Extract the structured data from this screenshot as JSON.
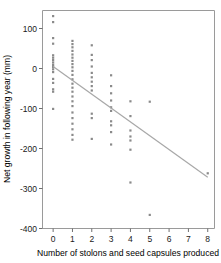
{
  "chart_data": {
    "type": "scatter",
    "title": "",
    "xlabel": "Number of stolons and seed capsules produced",
    "ylabel": "Net growth in following year (mm)",
    "xlim": [
      -0.55,
      8.35
    ],
    "ylim": [
      -400,
      145
    ],
    "xticks": [
      0,
      1,
      2,
      3,
      4,
      5,
      6,
      7,
      8
    ],
    "xticklabels": [
      "0",
      "1",
      "2",
      "3",
      "4",
      "5",
      "6",
      "7",
      "8"
    ],
    "yticks": [
      100,
      0,
      -100,
      -200,
      -300,
      -400
    ],
    "yticklabels": [
      "100",
      "0",
      "-100",
      "-200",
      "-300",
      "-400"
    ],
    "grid": false,
    "legend": null,
    "marker": "square",
    "marker_color": "#8a8a8a",
    "points": [
      {
        "x": 0,
        "y": 131
      },
      {
        "x": 0,
        "y": 116
      },
      {
        "x": 0,
        "y": 76
      },
      {
        "x": 0,
        "y": 62
      },
      {
        "x": 0,
        "y": 33
      },
      {
        "x": 0,
        "y": 27
      },
      {
        "x": 0,
        "y": 21
      },
      {
        "x": 0,
        "y": 15
      },
      {
        "x": 0,
        "y": 9
      },
      {
        "x": 0,
        "y": 4
      },
      {
        "x": 0,
        "y": -2
      },
      {
        "x": 0,
        "y": -9
      },
      {
        "x": 0,
        "y": -26
      },
      {
        "x": 0,
        "y": -36
      },
      {
        "x": 0,
        "y": -52
      },
      {
        "x": 0,
        "y": -58
      },
      {
        "x": 0,
        "y": -101
      },
      {
        "x": 1,
        "y": 69
      },
      {
        "x": 1,
        "y": 61
      },
      {
        "x": 1,
        "y": 53
      },
      {
        "x": 1,
        "y": 44
      },
      {
        "x": 1,
        "y": 35
      },
      {
        "x": 1,
        "y": 27
      },
      {
        "x": 1,
        "y": 19
      },
      {
        "x": 1,
        "y": 11
      },
      {
        "x": 1,
        "y": 3
      },
      {
        "x": 1,
        "y": -6
      },
      {
        "x": 1,
        "y": -16
      },
      {
        "x": 1,
        "y": -27
      },
      {
        "x": 1,
        "y": -38
      },
      {
        "x": 1,
        "y": -48
      },
      {
        "x": 1,
        "y": -58
      },
      {
        "x": 1,
        "y": -70
      },
      {
        "x": 1,
        "y": -82
      },
      {
        "x": 1,
        "y": -94
      },
      {
        "x": 1,
        "y": -110
      },
      {
        "x": 1,
        "y": -124
      },
      {
        "x": 1,
        "y": -138
      },
      {
        "x": 1,
        "y": -152
      },
      {
        "x": 1,
        "y": -166
      },
      {
        "x": 1,
        "y": -178
      },
      {
        "x": 2,
        "y": 58
      },
      {
        "x": 2,
        "y": 34
      },
      {
        "x": 2,
        "y": 21
      },
      {
        "x": 2,
        "y": 5
      },
      {
        "x": 2,
        "y": -11
      },
      {
        "x": 2,
        "y": -22
      },
      {
        "x": 2,
        "y": -33
      },
      {
        "x": 2,
        "y": -44
      },
      {
        "x": 2,
        "y": -55
      },
      {
        "x": 2,
        "y": -113
      },
      {
        "x": 2,
        "y": -124
      },
      {
        "x": 2,
        "y": -176
      },
      {
        "x": 3,
        "y": -17
      },
      {
        "x": 3,
        "y": -44
      },
      {
        "x": 3,
        "y": -62
      },
      {
        "x": 3,
        "y": -80
      },
      {
        "x": 3,
        "y": -97
      },
      {
        "x": 3,
        "y": -106
      },
      {
        "x": 3,
        "y": -132
      },
      {
        "x": 3,
        "y": -142
      },
      {
        "x": 3,
        "y": -159
      },
      {
        "x": 3,
        "y": -190
      },
      {
        "x": 4,
        "y": -82
      },
      {
        "x": 4,
        "y": -119
      },
      {
        "x": 4,
        "y": -155
      },
      {
        "x": 4,
        "y": -170
      },
      {
        "x": 4,
        "y": -180
      },
      {
        "x": 4,
        "y": -203
      },
      {
        "x": 4,
        "y": -285
      },
      {
        "x": 5,
        "y": -83
      },
      {
        "x": 5,
        "y": -366
      },
      {
        "x": 8,
        "y": -262
      }
    ],
    "fit_line": {
      "type": "linear-regression",
      "x_start": 0,
      "y_start": 5,
      "x_end": 8,
      "y_end": -272,
      "color": "#a8a8a8"
    }
  }
}
